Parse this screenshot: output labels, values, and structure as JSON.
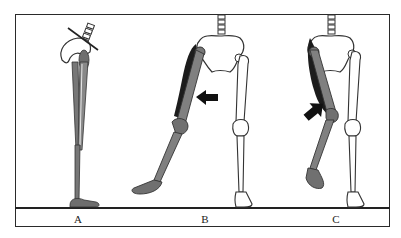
{
  "figure": {
    "panels": [
      {
        "label": "A",
        "description": "Lateral view of leg with pelvis; muscles highlighted; oblique line across spine/pelvis"
      },
      {
        "label": "B",
        "description": "Front view; left leg displaced laterally (abducted) and shaded; arrow pointing left"
      },
      {
        "label": "C",
        "description": "Front view; left leg shaded with knee bent inward; arrow pointing up-right"
      }
    ]
  },
  "colors": {
    "frame": "#2a2a2a",
    "bone_fill": "#ffffff",
    "muscle_shade": "#7a7a7a",
    "dark_shade": "#1a1a1a",
    "arrow": "#111111"
  }
}
